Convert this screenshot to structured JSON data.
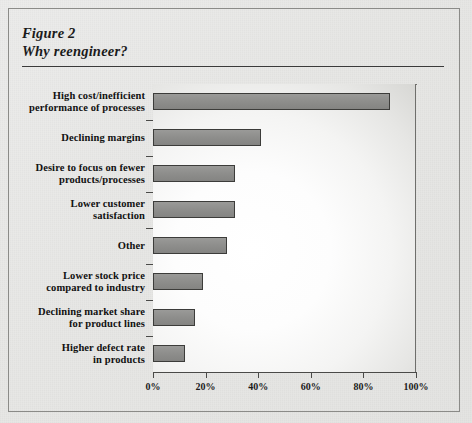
{
  "figure": {
    "number_label": "Figure 2",
    "title": "Why reengineer?"
  },
  "chart_data": {
    "type": "bar",
    "orientation": "horizontal",
    "title": "Why reengineer?",
    "subtitle": "Figure 2",
    "xlabel": "",
    "ylabel": "",
    "xlim": [
      0,
      100
    ],
    "xticks": [
      0,
      20,
      40,
      60,
      80,
      100
    ],
    "xtick_labels": [
      "0%",
      "20%",
      "40%",
      "60%",
      "80%",
      "100%"
    ],
    "grid": false,
    "legend": false,
    "bar_color": "#8e8e8c",
    "bar_edge_color": "#3c3c3a",
    "plot_background": "#ffffff",
    "figure_background": "#e9e9e7",
    "categories": [
      "High cost/inefficient performance of processes",
      "Declining margins",
      "Desire to focus on fewer products/processes",
      "Lower customer satisfaction",
      "Other",
      "Lower stock price compared to industry",
      "Declining market share for product lines",
      "Higher defect rate in products"
    ],
    "values": [
      90,
      41,
      31,
      31,
      28,
      19,
      16,
      12
    ],
    "units": "percent"
  },
  "categories_display": [
    {
      "line1": "High cost/inefficient",
      "line2": "performance of processes",
      "value": 90
    },
    {
      "line1": "Declining margins",
      "line2": "",
      "value": 41
    },
    {
      "line1": "Desire to focus on fewer",
      "line2": "products/processes",
      "value": 31
    },
    {
      "line1": "Lower customer",
      "line2": "satisfaction",
      "value": 31
    },
    {
      "line1": "Other",
      "line2": "",
      "value": 28
    },
    {
      "line1": "Lower stock price",
      "line2": "compared to industry",
      "value": 19
    },
    {
      "line1": "Declining market share",
      "line2": "for product lines",
      "value": 16
    },
    {
      "line1": "Higher defect rate",
      "line2": "in products",
      "value": 12
    }
  ],
  "axis": {
    "tick_labels": [
      "0%",
      "20%",
      "40%",
      "60%",
      "80%",
      "100%"
    ]
  }
}
